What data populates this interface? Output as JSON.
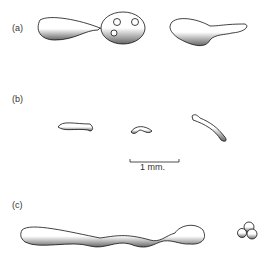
{
  "figure": {
    "panels": [
      {
        "label": "(a)",
        "description": "two droplets: elongated drop connected by thin thread to round drop with three bubbles; second elongated irregular drop"
      },
      {
        "label": "(b)",
        "description": "three small thread-like droplets"
      },
      {
        "label": "(c)",
        "description": "long elongated filament with bulb at end; small cluster of two droplets"
      }
    ],
    "scale_bar": {
      "label": "1 mm."
    }
  }
}
